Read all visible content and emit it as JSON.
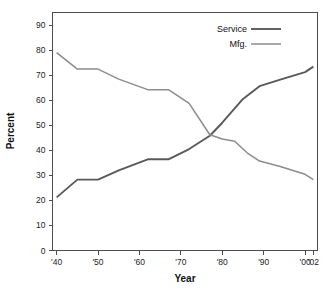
{
  "chart_data": {
    "type": "line",
    "title": "",
    "xlabel": "Year",
    "ylabel": "Percent",
    "xlim": [
      1939,
      2003
    ],
    "ylim": [
      0,
      95
    ],
    "grid": false,
    "legend_position": "top-right",
    "x_tick_labels": [
      "'40",
      "'50",
      "'60",
      "'70",
      "'80",
      "'90",
      "'00",
      "'02"
    ],
    "x_tick_values": [
      1940,
      1950,
      1960,
      1970,
      1980,
      1990,
      2000,
      2002
    ],
    "y_tick_labels": [
      "0",
      "10",
      "20",
      "30",
      "40",
      "50",
      "60",
      "70",
      "80",
      "90"
    ],
    "y_tick_values": [
      0,
      10,
      20,
      30,
      40,
      50,
      60,
      70,
      80,
      90
    ],
    "series": [
      {
        "name": "Service",
        "color": "#595959",
        "width": 1.9,
        "x": [
          1940,
          1945,
          1950,
          1955,
          1962,
          1967,
          1972,
          1977,
          1980,
          1985,
          1989,
          1994,
          2000,
          2002
        ],
        "values": [
          21.2,
          28.3,
          28.3,
          32.0,
          36.4,
          36.4,
          40.5,
          45.8,
          51.0,
          60.5,
          65.6,
          68.2,
          71.2,
          73.4
        ]
      },
      {
        "name": "Mfg.",
        "color": "#8c8c8c",
        "width": 1.5,
        "x": [
          1940,
          1945,
          1950,
          1955,
          1962,
          1967,
          1972,
          1977,
          1980,
          1983,
          1986,
          1989,
          1994,
          2000,
          2002
        ],
        "values": [
          79.0,
          72.4,
          72.4,
          68.4,
          64.2,
          64.2,
          58.7,
          46.2,
          44.5,
          43.6,
          39.0,
          35.7,
          33.5,
          30.4,
          28.3
        ]
      }
    ]
  },
  "legend": {
    "entries": [
      {
        "label": "Service",
        "color": "#595959",
        "width": 1.9
      },
      {
        "label": "Mfg.",
        "color": "#8c8c8c",
        "width": 1.5
      }
    ]
  },
  "axes": {
    "x_title": "Year",
    "y_title": "Percent"
  }
}
